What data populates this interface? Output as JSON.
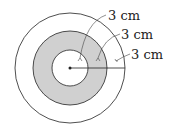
{
  "diagram": {
    "type": "concentric-circles",
    "center": [
      70,
      68
    ],
    "colors": {
      "stroke": "#222222",
      "ring_fill": "#d0d0d0",
      "background": "#ffffff"
    },
    "circles": [
      {
        "name": "outer",
        "radius": 55
      },
      {
        "name": "middle",
        "radius": 37
      },
      {
        "name": "inner",
        "radius": 18
      }
    ],
    "labels": [
      {
        "text": "3 cm",
        "x": 108,
        "y": 20
      },
      {
        "text": "3 cm",
        "x": 121,
        "y": 39
      },
      {
        "text": "3 cm",
        "x": 131,
        "y": 59
      }
    ]
  }
}
